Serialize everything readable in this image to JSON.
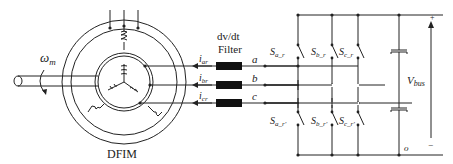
{
  "diagram": {
    "machine_label": "DFIM",
    "speed_symbol": "ω",
    "speed_sub": "m",
    "filter_label_1": "dv/dt",
    "filter_label_2": "Filter",
    "currents": [
      {
        "sym": "i",
        "sub": "ar"
      },
      {
        "sym": "i",
        "sub": "br"
      },
      {
        "sym": "i",
        "sub": "cr"
      }
    ],
    "phases": [
      "a",
      "b",
      "c"
    ],
    "upper_switches": [
      {
        "sym": "S",
        "sub": "a_r"
      },
      {
        "sym": "S",
        "sub": "b_r"
      },
      {
        "sym": "S",
        "sub": "c_r"
      }
    ],
    "lower_switches": [
      {
        "sym": "S",
        "sub": "a_r'"
      },
      {
        "sym": "S",
        "sub": "b_r'"
      },
      {
        "sym": "S",
        "sub": "c_r'"
      }
    ],
    "bus_voltage": {
      "sym": "V",
      "sub": "bus"
    },
    "plus": "+",
    "minus": "−",
    "node_o": "o"
  }
}
